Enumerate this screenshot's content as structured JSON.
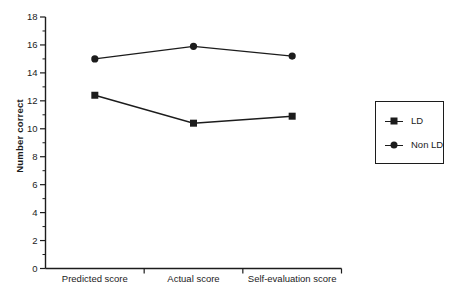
{
  "figure": {
    "background": "#ffffff",
    "ink_color": "#1c1c1c"
  },
  "chart_data": {
    "type": "line",
    "title": "",
    "categories": [
      "Predicted score",
      "Actual score",
      "Self-evaluation score"
    ],
    "series": [
      {
        "name": "LD",
        "marker": "square",
        "color": "#1c1c1c",
        "values": [
          12.4,
          10.4,
          10.9
        ]
      },
      {
        "name": "Non LD",
        "marker": "circle",
        "color": "#1c1c1c",
        "values": [
          15.0,
          15.9,
          15.2
        ]
      }
    ],
    "xlabel": "",
    "ylabel": "Number correct",
    "ylim": [
      0,
      18
    ],
    "ytick_step": 2,
    "yminor_step": 1,
    "grid": false,
    "legend_position": "right-outside",
    "legend_border": true
  }
}
